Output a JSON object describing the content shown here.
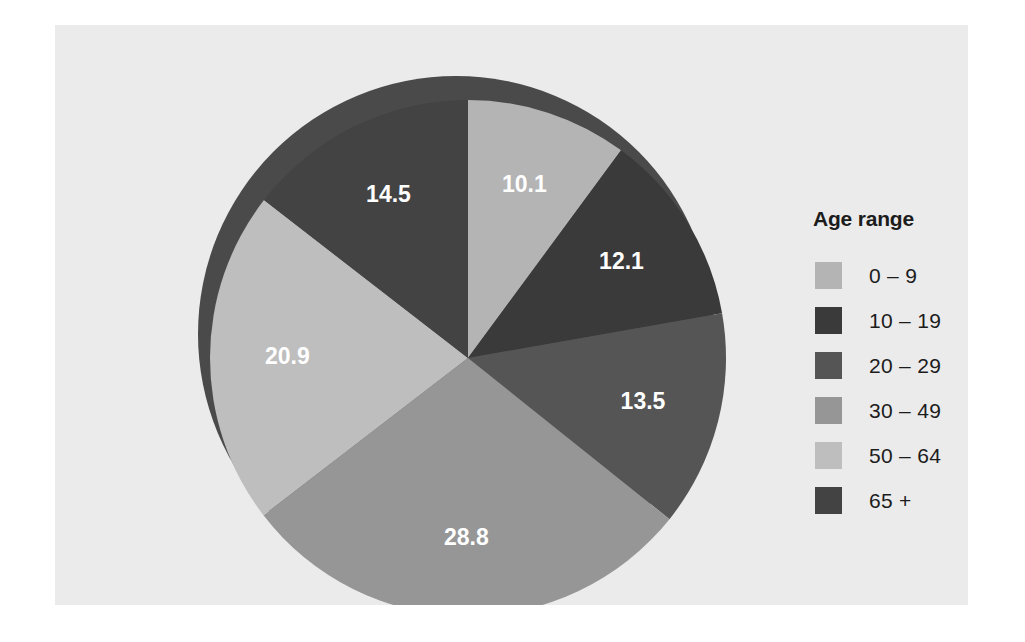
{
  "figure": {
    "background_color": "#ebebeb",
    "page_background": "#ffffff"
  },
  "legend": {
    "title": "Age range",
    "items": [
      {
        "label": "0 – 9",
        "color": "#b4b4b4"
      },
      {
        "label": "10 – 19",
        "color": "#3a3a3a"
      },
      {
        "label": "20 – 29",
        "color": "#555555"
      },
      {
        "label": "30 – 49",
        "color": "#969696"
      },
      {
        "label": "50 – 64",
        "color": "#bebebe"
      },
      {
        "label": "65 +",
        "color": "#434343"
      }
    ]
  },
  "chart_data": {
    "type": "pie",
    "title": "",
    "legend_title": "Age range",
    "legend_position": "right",
    "start_angle_deg": 0,
    "direction": "clockwise",
    "three_d": true,
    "depth_shadow_color": "#4a4a4a",
    "label_color": "#ffffff",
    "total": 99.9,
    "categories": [
      "0 – 9",
      "10 – 19",
      "20 – 29",
      "30 – 49",
      "50 – 64",
      "65 +"
    ],
    "values": [
      10.1,
      12.1,
      13.5,
      28.8,
      20.9,
      14.5
    ],
    "labels": [
      "10.1",
      "12.1",
      "13.5",
      "28.8",
      "20.9",
      "14.5"
    ],
    "colors": [
      "#b4b4b4",
      "#3a3a3a",
      "#555555",
      "#969696",
      "#bebebe",
      "#434343"
    ],
    "slices": [
      {
        "category": "0 – 9",
        "value": 10.1,
        "label": "10.1",
        "color": "#b4b4b4",
        "angle_deg": 36.4
      },
      {
        "category": "10 – 19",
        "value": 12.1,
        "label": "12.1",
        "color": "#3a3a3a",
        "angle_deg": 43.6
      },
      {
        "category": "20 – 29",
        "value": 13.5,
        "label": "13.5",
        "color": "#555555",
        "angle_deg": 48.6
      },
      {
        "category": "30 – 49",
        "value": 28.8,
        "label": "28.8",
        "color": "#969696",
        "angle_deg": 103.8
      },
      {
        "category": "50 – 64",
        "value": 20.9,
        "label": "20.9",
        "color": "#bebebe",
        "angle_deg": 75.3
      },
      {
        "category": "65 +",
        "value": 14.5,
        "label": "14.5",
        "color": "#434343",
        "angle_deg": 52.3
      }
    ]
  }
}
